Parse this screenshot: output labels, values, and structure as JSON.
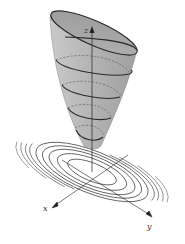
{
  "figure": {
    "axes": {
      "z_label": "z",
      "x_label": "x",
      "y_label": "y"
    },
    "colors": {
      "surface_fill": "#b8b8b8",
      "surface_inner": "#9a9a9a",
      "trace_curve": "#2a2a2a",
      "contour": "#3a3a3a",
      "axis": "#222222",
      "background": "#ffffff"
    },
    "trace_count": 4,
    "contour_count": 8
  }
}
